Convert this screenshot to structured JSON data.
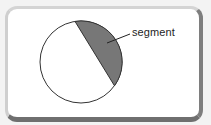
{
  "diagram": {
    "label": "segment",
    "colors": {
      "segment_fill": "#777777",
      "circle_fill": "#ffffff",
      "outline": "#333333",
      "frame_border": "#7a7a7a"
    },
    "circle": {
      "cx": 81,
      "cy": 62,
      "r": 41
    },
    "chord": {
      "x1": 75,
      "y1": 21,
      "x2": 114,
      "y2": 88
    }
  }
}
